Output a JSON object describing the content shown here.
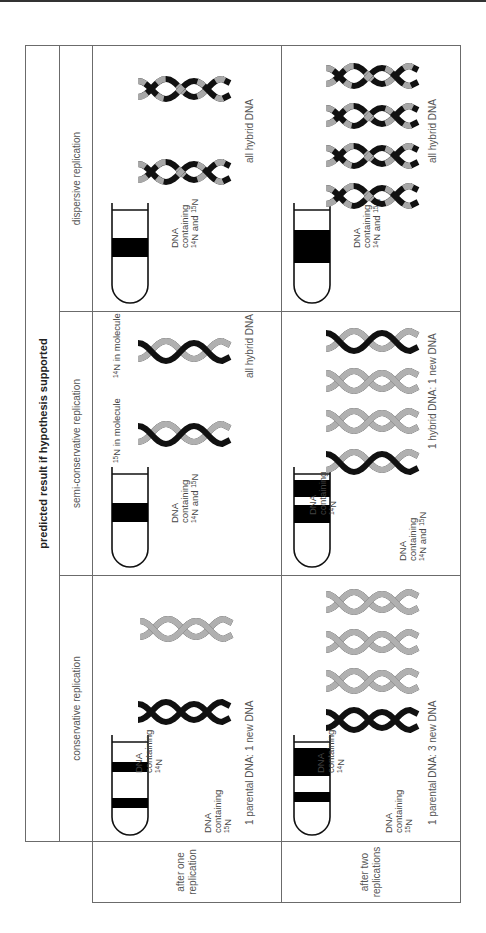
{
  "title": "predicted result if hypothesis supported",
  "methods": [
    {
      "id": "conservative",
      "label": "conservative replication"
    },
    {
      "id": "semi",
      "label": "semi-conservative replication"
    },
    {
      "id": "dispersive",
      "label": "dispersive replication"
    }
  ],
  "rows": [
    {
      "label_line1": "after one",
      "label_line2": "replication"
    },
    {
      "label_line1": "after two",
      "label_line2": "replications"
    }
  ],
  "band_labels": {
    "dna": "DNA",
    "containing": "containing",
    "n14": "14",
    "n15": "15",
    "N": "N",
    "and": " and "
  },
  "semi_molecule_labels": {
    "n15_in_molecule": "N in molecule",
    "n14_in_molecule": "N in molecule"
  },
  "captions": {
    "conservative_one": "1 parental DNA: 1 new DNA",
    "conservative_two": "1 parental DNA: 3 new DNA",
    "semi_one": "all hybrid DNA",
    "semi_two": "1 hybrid DNA: 1 new DNA",
    "dispersive_one": "all hybrid DNA",
    "dispersive_two": "all hybrid DNA"
  },
  "colors": {
    "n15_strand": "#111111",
    "n14_strand": "#a8a8a8",
    "band": "#000000",
    "border": "#6b6b6b"
  }
}
